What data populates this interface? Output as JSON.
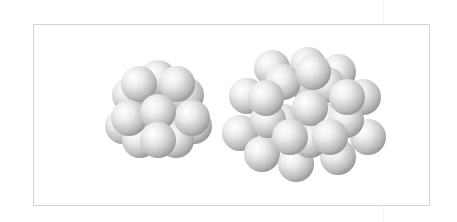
{
  "figure": {
    "sphere_color": "#e6e6e6",
    "sphere_highlight": "#ffffff",
    "sphere_shadow": "#9a9a9a",
    "frame_color": "#d4d4d4"
  },
  "clusters": [
    {
      "name": "small-cluster",
      "radius": 18,
      "spheres": [
        [
          158,
          78
        ],
        [
          130,
          95
        ],
        [
          186,
          95
        ],
        [
          123,
          126
        ],
        [
          194,
          126
        ],
        [
          140,
          140
        ],
        [
          176,
          140
        ],
        [
          139,
          84
        ],
        [
          177,
          84
        ],
        [
          129,
          118
        ],
        [
          192,
          118
        ],
        [
          158,
          112
        ],
        [
          158,
          140
        ]
      ]
    },
    {
      "name": "large-cluster",
      "radius": 18,
      "spheres": [
        [
          272,
          68
        ],
        [
          308,
          65
        ],
        [
          338,
          72
        ],
        [
          247,
          96
        ],
        [
          363,
          97
        ],
        [
          305,
          82
        ],
        [
          283,
          82
        ],
        [
          327,
          85
        ],
        [
          240,
          133
        ],
        [
          368,
          137
        ],
        [
          262,
          154
        ],
        [
          296,
          164
        ],
        [
          338,
          157
        ],
        [
          283,
          122
        ],
        [
          330,
          122
        ],
        [
          268,
          120
        ],
        [
          346,
          120
        ],
        [
          310,
          140
        ],
        [
          313,
          72
        ],
        [
          266,
          98
        ],
        [
          347,
          97
        ],
        [
          310,
          108
        ],
        [
          290,
          137
        ],
        [
          330,
          137
        ]
      ]
    }
  ]
}
